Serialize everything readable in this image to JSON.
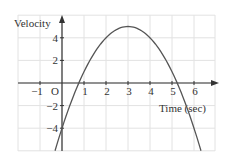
{
  "chart_data": {
    "type": "line",
    "title": "",
    "xlabel": "Time (sec)",
    "ylabel": "Velocity",
    "origin_label": "O",
    "x_ticks": [
      -1,
      1,
      2,
      3,
      4,
      5,
      6
    ],
    "y_ticks": [
      -4,
      -2,
      2,
      4
    ],
    "xlim": [
      -2,
      6.9
    ],
    "ylim": [
      -6,
      6
    ],
    "grid": true,
    "function": "v = -(t-3)^2 + 5",
    "series": [
      {
        "name": "velocity",
        "x": [
          -0.32,
          0,
          0.76,
          1,
          2,
          3,
          4,
          5,
          5.24,
          6,
          6.32
        ],
        "values": [
          -6,
          -4,
          0,
          1,
          4,
          5,
          4,
          1,
          0,
          -4,
          -6
        ]
      }
    ],
    "colors": {
      "curve": "#555555",
      "grid": "#e2e2e2",
      "axis": "#333333"
    }
  }
}
